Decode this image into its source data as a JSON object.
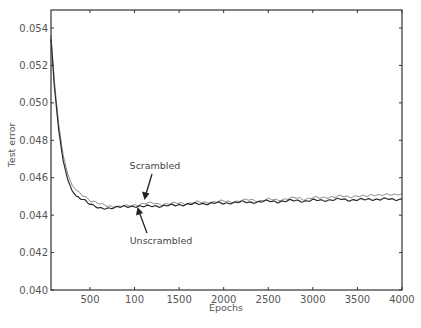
{
  "chart_data": {
    "type": "line",
    "title": "",
    "xlabel": "Epochs",
    "ylabel": "Test error",
    "xlim": [
      63,
      4000
    ],
    "ylim": [
      0.04,
      0.055
    ],
    "grid": false,
    "legend": "none (inline annotations with arrows)",
    "x_ticks": [
      500,
      1000,
      1500,
      2000,
      2500,
      3000,
      3500,
      4000
    ],
    "x_tick_labels": [
      "500",
      "100",
      "1500",
      "2000",
      "2500",
      "3000",
      "3500",
      "4000"
    ],
    "y_ticks": [
      0.04,
      0.042,
      0.044,
      0.046,
      0.048,
      0.05,
      0.052,
      0.054
    ],
    "y_tick_labels": [
      "0.040",
      "0.042",
      "0.044",
      "0.046",
      "0.048",
      "0.050",
      "0.052",
      "0.054"
    ],
    "x": [
      63,
      100,
      150,
      200,
      250,
      300,
      350,
      400,
      450,
      500,
      600,
      700,
      800,
      900,
      1000,
      1100,
      1200,
      1300,
      1400,
      1500,
      1600,
      1700,
      1800,
      1900,
      2000,
      2100,
      2200,
      2300,
      2400,
      2500,
      2600,
      2700,
      2800,
      2900,
      3000,
      3100,
      3200,
      3300,
      3400,
      3500,
      3600,
      3700,
      3800,
      3900,
      4000
    ],
    "series": [
      {
        "name": "Scrambled",
        "color": "#8a8a8a",
        "values": [
          0.0536,
          0.0512,
          0.0488,
          0.0472,
          0.0462,
          0.0456,
          0.0453,
          0.0451,
          0.045,
          0.0448,
          0.0446,
          0.0445,
          0.04445,
          0.04448,
          0.04455,
          0.0446,
          0.04465,
          0.04458,
          0.0446,
          0.04465,
          0.04462,
          0.0447,
          0.04468,
          0.04472,
          0.04475,
          0.0447,
          0.04478,
          0.04482,
          0.04476,
          0.04485,
          0.0448,
          0.04488,
          0.04492,
          0.04485,
          0.04495,
          0.0449,
          0.04498,
          0.04502,
          0.04495,
          0.04505,
          0.045,
          0.04508,
          0.04512,
          0.04505,
          0.04515
        ]
      },
      {
        "name": "Unscrambled",
        "color": "#2a2a2a",
        "values": [
          0.0534,
          0.0509,
          0.0485,
          0.0469,
          0.0459,
          0.0453,
          0.045,
          0.0449,
          0.0448,
          0.0446,
          0.04435,
          0.04438,
          0.04442,
          0.04445,
          0.04448,
          0.04445,
          0.0445,
          0.04448,
          0.04452,
          0.04455,
          0.04458,
          0.0446,
          0.04462,
          0.04465,
          0.04462,
          0.04468,
          0.0447,
          0.04468,
          0.04472,
          0.04475,
          0.04472,
          0.04476,
          0.04478,
          0.04475,
          0.0448,
          0.04478,
          0.04482,
          0.04485,
          0.0448,
          0.04484,
          0.04482,
          0.04485,
          0.04488,
          0.04482,
          0.04485
        ]
      }
    ],
    "annotations": [
      {
        "text": "Scrambled",
        "label_xy": [
          1250,
          0.0459
        ],
        "arrow_to": [
          1050,
          0.04462
        ]
      },
      {
        "text": "Unscrambled",
        "label_xy": [
          1300,
          0.0442
        ],
        "arrow_to": [
          1030,
          0.04445
        ]
      }
    ]
  },
  "ui": {
    "frame_color": "#333333",
    "tick_text_color": "#555555"
  }
}
